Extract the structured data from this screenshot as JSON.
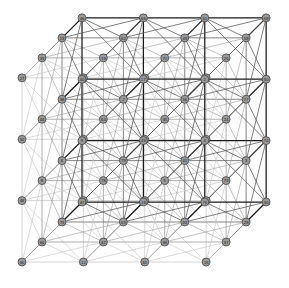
{
  "figure": {
    "background_color": "#ffffff",
    "node_fill_color": "#9a9a9a",
    "node_stroke_color": "#3a3a3a",
    "node_label_color": "#1a1a1a",
    "edge_front_color": "#1a1a1a",
    "edge_mid_color": "#6e6e6e",
    "edge_back_color": "#b8b8b8",
    "node_radius": 4.0,
    "lattice": {
      "nx": 4,
      "ny": 4,
      "nz": 4,
      "total_nodes": 64
    },
    "projection": {
      "origin_x": 14,
      "origin_y": 258,
      "step_x": 57.5,
      "step_y": -57.5,
      "depth_dx": 20.5,
      "depth_dy": -20.5
    }
  },
  "chart_data": {
    "type": "scatter",
    "xlabel": "",
    "ylabel": "",
    "grid": false,
    "legend": "none",
    "node_labels": [
      "50",
      "12",
      "61",
      "16",
      "48",
      "72",
      "57",
      "31",
      "52",
      "20",
      "14",
      "29",
      "27",
      "67",
      "22",
      "59",
      "66",
      "42",
      "36",
      "37",
      "8",
      "78",
      "5",
      "73",
      "44",
      "64",
      "35",
      "24",
      "33",
      "19",
      "71",
      "26",
      "75",
      "69",
      "63",
      "28",
      "6",
      "79",
      "41",
      "3",
      "38",
      "7",
      "56",
      "77",
      "13",
      "62",
      "49",
      "58",
      "47",
      "18",
      "76",
      "30",
      "9",
      "45",
      "4",
      "74",
      "40",
      "17",
      "2",
      "60",
      "46",
      "65",
      "51",
      "68",
      "15",
      "53",
      "43",
      "10",
      "61b",
      "34",
      "23",
      "55",
      "21",
      "70",
      "32",
      "39",
      "11",
      "54",
      "1",
      "25"
    ],
    "nodes": [
      {
        "id": "1",
        "x": 0,
        "y": 0,
        "z": 3
      },
      {
        "id": "50",
        "x": 0,
        "y": 3,
        "z": 3
      },
      {
        "id": "12",
        "x": 1.5,
        "y": 3,
        "z": 3
      },
      {
        "id": "61",
        "x": 3,
        "y": 3,
        "z": 3
      },
      {
        "id": "72",
        "x": 0,
        "y": 2,
        "z": 3
      },
      {
        "id": "57",
        "x": 1,
        "y": 2.6,
        "z": 3
      },
      {
        "id": "16",
        "x": 0.5,
        "y": 3,
        "z": 3
      },
      {
        "id": "48",
        "x": 2.5,
        "y": 3,
        "z": 3
      },
      {
        "id": "14",
        "x": 3,
        "y": 2.5,
        "z": 3
      },
      {
        "id": "31",
        "x": 1.5,
        "y": 2.5,
        "z": 3
      },
      {
        "id": "52",
        "x": 2.2,
        "y": 2.6,
        "z": 3
      },
      {
        "id": "20",
        "x": 2.7,
        "y": 2.5,
        "z": 3
      },
      {
        "id": "29",
        "x": 0.5,
        "y": 2.3,
        "z": 3
      },
      {
        "id": "27",
        "x": 1.8,
        "y": 2.2,
        "z": 3
      },
      {
        "id": "67",
        "x": 2.6,
        "y": 2.2,
        "z": 3
      },
      {
        "id": "22",
        "x": 0.8,
        "y": 2.0,
        "z": 3
      },
      {
        "id": "59",
        "x": 1.2,
        "y": 2.0,
        "z": 3
      },
      {
        "id": "66",
        "x": 2.0,
        "y": 2.0,
        "z": 3
      },
      {
        "id": "42",
        "x": 2.4,
        "y": 2.0,
        "z": 3
      },
      {
        "id": "36",
        "x": 3.0,
        "y": 2.0,
        "z": 3
      },
      {
        "id": "78",
        "x": 0.3,
        "y": 1.8,
        "z": 3
      },
      {
        "id": "37",
        "x": 1.4,
        "y": 1.8,
        "z": 3
      },
      {
        "id": "8",
        "x": 2.6,
        "y": 1.8,
        "z": 3
      },
      {
        "id": "44",
        "x": 0.5,
        "y": 1.6,
        "z": 3
      },
      {
        "id": "6",
        "x": 1.6,
        "y": 1.6,
        "z": 3
      },
      {
        "id": "73",
        "x": 2.8,
        "y": 1.6,
        "z": 3
      },
      {
        "id": "64",
        "x": 0.8,
        "y": 1.5,
        "z": 3
      },
      {
        "id": "35",
        "x": 1.9,
        "y": 1.5,
        "z": 3
      },
      {
        "id": "24",
        "x": 3.0,
        "y": 1.5,
        "z": 3
      },
      {
        "id": "33",
        "x": 1.0,
        "y": 1.35,
        "z": 3
      },
      {
        "id": "19",
        "x": 2.1,
        "y": 1.35,
        "z": 3
      },
      {
        "id": "71",
        "x": 3.1,
        "y": 1.35,
        "z": 3
      },
      {
        "id": "5",
        "x": 0.4,
        "y": 1.2,
        "z": 3
      },
      {
        "id": "26",
        "x": 1.2,
        "y": 1.2,
        "z": 3
      },
      {
        "id": "75",
        "x": 1.6,
        "y": 1.2,
        "z": 3
      },
      {
        "id": "69",
        "x": 2.4,
        "y": 1.2,
        "z": 3
      },
      {
        "id": "63",
        "x": 2.8,
        "y": 1.2,
        "z": 3
      },
      {
        "id": "28",
        "x": 3.3,
        "y": 1.2,
        "z": 3
      },
      {
        "id": "79",
        "x": 0.6,
        "y": 1.0,
        "z": 3
      },
      {
        "id": "41",
        "x": 1.8,
        "y": 1.0,
        "z": 3
      },
      {
        "id": "3",
        "x": 3.0,
        "y": 1.0,
        "z": 3
      },
      {
        "id": "38",
        "x": 0.9,
        "y": 0.85,
        "z": 3
      },
      {
        "id": "7",
        "x": 2.0,
        "y": 0.85,
        "z": 3
      },
      {
        "id": "54",
        "x": 0.0,
        "y": 0.8,
        "z": 3
      },
      {
        "id": "13",
        "x": 1.3,
        "y": 0.8,
        "z": 3
      },
      {
        "id": "56",
        "x": 2.4,
        "y": 0.8,
        "z": 3
      },
      {
        "id": "77",
        "x": 3.2,
        "y": 0.8,
        "z": 3
      },
      {
        "id": "11",
        "x": 0.3,
        "y": 0.65,
        "z": 3
      },
      {
        "id": "62",
        "x": 1.5,
        "y": 0.65,
        "z": 3
      },
      {
        "id": "49",
        "x": 2.7,
        "y": 0.65,
        "z": 3
      },
      {
        "id": "58",
        "x": 0.5,
        "y": 0.5,
        "z": 3
      },
      {
        "id": "47",
        "x": 1.7,
        "y": 0.5,
        "z": 3
      },
      {
        "id": "18",
        "x": 2.9,
        "y": 0.5,
        "z": 3
      },
      {
        "id": "9",
        "x": 0.8,
        "y": 0.4,
        "z": 3
      },
      {
        "id": "76",
        "x": 2.0,
        "y": 0.4,
        "z": 3
      },
      {
        "id": "30",
        "x": 3.1,
        "y": 0.4,
        "z": 3
      },
      {
        "id": "74",
        "x": 1.0,
        "y": 0.25,
        "z": 3
      },
      {
        "id": "45",
        "x": 2.2,
        "y": 0.25,
        "z": 3
      },
      {
        "id": "4",
        "x": 3.3,
        "y": 0.25,
        "z": 3
      },
      {
        "id": "40",
        "x": 1.2,
        "y": 0.1,
        "z": 3
      },
      {
        "id": "17",
        "x": 1.6,
        "y": 0.1,
        "z": 3
      },
      {
        "id": "2",
        "x": 2.4,
        "y": 0.1,
        "z": 3
      },
      {
        "id": "60",
        "x": 2.8,
        "y": 0.1,
        "z": 3
      },
      {
        "id": "81",
        "x": 3.4,
        "y": 0.1,
        "z": 3
      },
      {
        "id": "46",
        "x": 0.5,
        "y": 0.0,
        "z": 3
      },
      {
        "id": "15",
        "x": 0.8,
        "y": -0.1,
        "z": 3
      },
      {
        "id": "65",
        "x": 1.8,
        "y": -0.1,
        "z": 3
      },
      {
        "id": "43",
        "x": 3.0,
        "y": -0.1,
        "z": 3
      },
      {
        "id": "53",
        "x": 1.0,
        "y": -0.25,
        "z": 3
      },
      {
        "id": "51",
        "x": 2.0,
        "y": -0.25,
        "z": 3
      },
      {
        "id": "25",
        "x": 2.6,
        "y": -0.25,
        "z": 3
      },
      {
        "id": "10",
        "x": 3.2,
        "y": -0.25,
        "z": 3
      },
      {
        "id": "68",
        "x": 0.1,
        "y": -0.3,
        "z": 3
      },
      {
        "id": "55",
        "x": 1.4,
        "y": -0.35,
        "z": 3
      },
      {
        "id": "34",
        "x": 0.4,
        "y": -0.5,
        "z": 3
      },
      {
        "id": "23",
        "x": 1.6,
        "y": -0.5,
        "z": 3
      },
      {
        "id": "39",
        "x": 2.8,
        "y": -0.5,
        "z": 3
      },
      {
        "id": "21",
        "x": 0.6,
        "y": -0.65,
        "z": 3
      },
      {
        "id": "70",
        "x": 1.8,
        "y": -0.65,
        "z": 3
      },
      {
        "id": "32",
        "x": 3.0,
        "y": -0.65,
        "z": 3
      }
    ]
  },
  "node_grid_labels": [
    [
      "68",
      "21",
      "34",
      "46",
      "15",
      "53",
      "9",
      "74",
      "40",
      "52",
      "23",
      "55",
      "17",
      "65",
      "51",
      "2",
      "60",
      "25",
      "10",
      "43",
      "32",
      "39",
      "70",
      "81",
      "4",
      "30"
    ],
    [
      "54",
      "11",
      "58",
      "5",
      "79",
      "38",
      "13",
      "62",
      "47",
      "26",
      "75",
      "41",
      "7",
      "63",
      "69",
      "56",
      "49",
      "18",
      "77",
      "3",
      "28",
      "71",
      "24",
      "76",
      "45",
      "17"
    ],
    [
      "1",
      "78",
      "44",
      "72",
      "29",
      "22",
      "64",
      "33",
      "6",
      "57",
      "16",
      "59",
      "37",
      "35",
      "19",
      "42",
      "8",
      "73",
      "36",
      "67",
      "14",
      "48",
      "20",
      "50",
      "12",
      "61"
    ]
  ],
  "levels": {
    "top_face": [
      "50",
      "16",
      "12",
      "57",
      "31",
      "52",
      "61",
      "48",
      "20",
      "14",
      "72",
      "29",
      "22",
      "59",
      "66",
      "67",
      "42",
      "36",
      "37",
      "8",
      "1",
      "78",
      "44"
    ],
    "front_face": [
      "1",
      "54",
      "11",
      "58",
      "68",
      "21",
      "34",
      "46",
      "15",
      "53",
      "9",
      "74",
      "40",
      "5",
      "79",
      "38",
      "13",
      "62",
      "47"
    ],
    "right_face": [
      "14",
      "36",
      "73",
      "24",
      "71",
      "28",
      "3",
      "77",
      "30",
      "4",
      "81",
      "43",
      "10",
      "32",
      "39",
      "25",
      "60",
      "18",
      "49",
      "63"
    ],
    "bottom_face": [
      "68",
      "21",
      "34",
      "46",
      "15",
      "53",
      "23",
      "55",
      "70",
      "51",
      "65",
      "17",
      "40",
      "2",
      "60",
      "25",
      "32",
      "10",
      "43"
    ]
  }
}
